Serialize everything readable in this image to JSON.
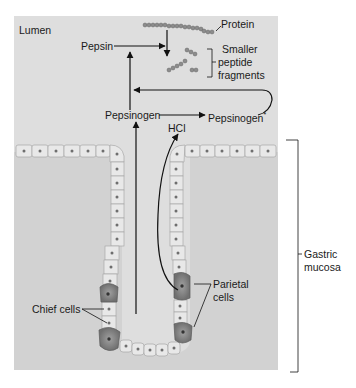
{
  "diagram": {
    "region_label": "Lumen",
    "labels": {
      "pepsin": "Pepsin",
      "pepsinogen": "Pepsinogen",
      "pepsinogen_star": "Pepsinogen",
      "star": "*",
      "hcl": "HCl",
      "protein": "Protein",
      "fragments_1": "Smaller",
      "fragments_2": "peptide",
      "fragments_3": "fragments",
      "gastric_1": "Gastric",
      "gastric_2": "mucosa",
      "chief": "Chief cells",
      "parietal_1": "Parietal",
      "parietal_2": "cells"
    },
    "colors": {
      "panel": "#dcdcdc",
      "cell_fill": "#e6e6e6",
      "cell_border": "#a8a8a8",
      "nucleus": "#6e6e6e",
      "parietal_fill": "#8a8a8a",
      "line": "#111111",
      "protein_bead": "#8c8c8c"
    }
  }
}
